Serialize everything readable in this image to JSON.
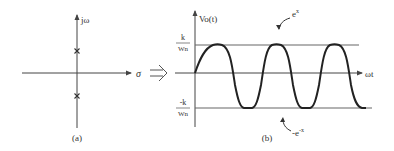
{
  "figure": {
    "left_panel": {
      "caption": "(a)",
      "vertical_axis_label": "jω",
      "horizontal_axis_label": "σ",
      "poles": [
        {
          "marker": "x",
          "position": "upper imaginary axis"
        },
        {
          "marker": "x",
          "position": "lower imaginary axis"
        }
      ]
    },
    "implies_symbol": "⟹",
    "right_panel": {
      "caption": "(b)",
      "vertical_axis_label": "Vo(t)",
      "horizontal_axis_label": "ωt",
      "upper_level_label_num": "k",
      "upper_level_label_den": "Wn",
      "lower_level_label_num": "-k",
      "lower_level_label_den": "Wn",
      "upper_envelope_label": "e",
      "upper_envelope_exp": "x",
      "lower_envelope_label": "-e",
      "lower_envelope_exp": "-x"
    }
  },
  "colors": {
    "axis": "#444444",
    "wave": "#222222",
    "envelope": "#666666",
    "text": "#333333"
  }
}
